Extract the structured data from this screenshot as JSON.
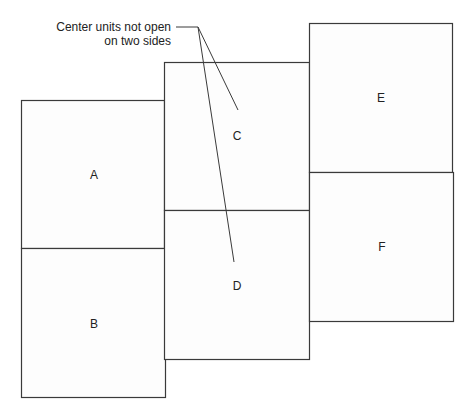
{
  "diagram": {
    "annotation": {
      "line1": "Center units not open",
      "line2": "on two sides",
      "points_to": [
        "C",
        "D"
      ]
    },
    "units": [
      {
        "id": "A",
        "label": "A",
        "column": "left",
        "position": "top"
      },
      {
        "id": "B",
        "label": "B",
        "column": "left",
        "position": "bottom"
      },
      {
        "id": "C",
        "label": "C",
        "column": "center",
        "position": "top"
      },
      {
        "id": "D",
        "label": "D",
        "column": "center",
        "position": "bottom"
      },
      {
        "id": "E",
        "label": "E",
        "column": "right",
        "position": "top"
      },
      {
        "id": "F",
        "label": "F",
        "column": "right",
        "position": "bottom"
      }
    ],
    "line_color": "#3a3a3a"
  }
}
